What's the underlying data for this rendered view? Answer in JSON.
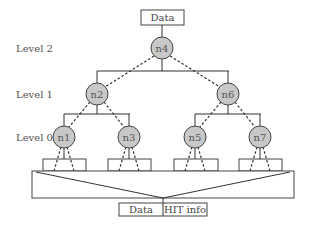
{
  "diagram": {
    "top_box": {
      "label": "Data"
    },
    "levels": [
      {
        "label": "Level 2",
        "y": 48
      },
      {
        "label": "Level 1",
        "y": 94
      },
      {
        "label": "Level 0",
        "y": 137
      }
    ],
    "nodes": [
      {
        "id": "n4",
        "label": "n4",
        "level": 2,
        "cx": 162,
        "cy": 48
      },
      {
        "id": "n2",
        "label": "n2",
        "level": 1,
        "cx": 97,
        "cy": 94
      },
      {
        "id": "n6",
        "label": "n6",
        "level": 1,
        "cx": 228,
        "cy": 94
      },
      {
        "id": "n1",
        "label": "n1",
        "level": 0,
        "cx": 64,
        "cy": 137
      },
      {
        "id": "n3",
        "label": "n3",
        "level": 0,
        "cx": 129,
        "cy": 137
      },
      {
        "id": "n5",
        "label": "n5",
        "level": 0,
        "cx": 195,
        "cy": 137
      },
      {
        "id": "n7",
        "label": "n7",
        "level": 0,
        "cx": 260,
        "cy": 137
      }
    ],
    "edges": [
      {
        "from": "n4",
        "to": "n2"
      },
      {
        "from": "n4",
        "to": "n6"
      },
      {
        "from": "n2",
        "to": "n1"
      },
      {
        "from": "n2",
        "to": "n3"
      },
      {
        "from": "n6",
        "to": "n5"
      },
      {
        "from": "n6",
        "to": "n7"
      }
    ],
    "bottom_box": {
      "left_label": "Data",
      "right_label": "HIT info"
    },
    "colors": {
      "node_fill": "#c8c8c8",
      "stroke": "#333333",
      "text": "#555555"
    }
  }
}
